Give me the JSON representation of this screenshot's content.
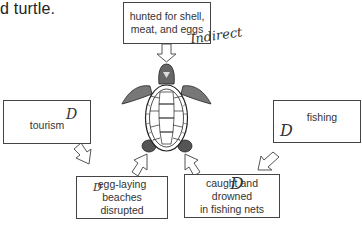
{
  "caption": "d turtle.",
  "diagram": {
    "center": "sea-turtle-illustration",
    "boxes": [
      {
        "id": "top",
        "label_lines": [
          "hunted for shell,",
          "meat, and eggs"
        ],
        "annotation": "Indirect"
      },
      {
        "id": "left",
        "label_lines": [
          "tourism"
        ],
        "annotation": "D"
      },
      {
        "id": "right",
        "label_lines": [
          "fishing"
        ],
        "annotation": "D"
      },
      {
        "id": "bottom-left",
        "label_lines": [
          "egg-laying beaches",
          "disrupted"
        ],
        "annotation": "D"
      },
      {
        "id": "bottom-right",
        "label_lines": [
          "caught and drowned",
          "in fishing nets"
        ],
        "annotation": "D"
      }
    ],
    "arrows": [
      {
        "from": "top",
        "to": "turtle"
      },
      {
        "from": "left",
        "to": "bottom-left"
      },
      {
        "from": "bottom-left",
        "to": "turtle"
      },
      {
        "from": "bottom-right",
        "to": "turtle"
      },
      {
        "from": "right",
        "to": "bottom-right"
      }
    ]
  },
  "colors": {
    "line": "#444444",
    "text": "#333333",
    "background": "#ffffff"
  }
}
